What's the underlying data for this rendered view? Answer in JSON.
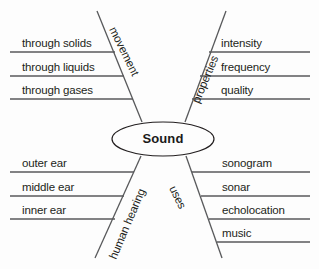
{
  "diagram": {
    "title": "Sound",
    "type": "concept-map",
    "center": {
      "label": "Sound",
      "shape": "ellipse",
      "cx": 163,
      "cy": 139,
      "rx": 51,
      "ry": 17
    },
    "colors": {
      "stroke": "#58595b",
      "text": "#231f20",
      "background": "#fdfdfd",
      "center_stroke": "#231f20"
    },
    "branches": [
      {
        "id": "movement",
        "label": "movement",
        "position": "top-left",
        "rotation_deg": 64,
        "label_x": 112,
        "label_y": 22,
        "stem": {
          "x1": 97,
          "y1": 11,
          "x2": 142,
          "y2": 122
        },
        "items": [
          {
            "text": "through solids",
            "line_y": 52,
            "line_x1": 10,
            "line_x2": 115,
            "text_x": 22,
            "text_y": 38
          },
          {
            "text": "through liquids",
            "line_y": 76,
            "line_x1": 10,
            "line_x2": 124,
            "text_x": 22,
            "text_y": 62
          },
          {
            "text": "through gases",
            "line_y": 99,
            "line_x1": 10,
            "line_x2": 133,
            "text_x": 22,
            "text_y": 85
          }
        ]
      },
      {
        "id": "properties",
        "label": "properties",
        "position": "top-right",
        "rotation_deg": -67,
        "label_x": 196,
        "label_y": 97,
        "stem": {
          "x1": 226,
          "y1": 11,
          "x2": 185,
          "y2": 122
        },
        "items": [
          {
            "text": "intensity",
            "line_y": 52,
            "line_x1": 209,
            "line_x2": 310,
            "text_x": 221,
            "text_y": 38
          },
          {
            "text": "frequency",
            "line_y": 76,
            "line_x1": 200,
            "line_x2": 310,
            "text_x": 221,
            "text_y": 62
          },
          {
            "text": "quality",
            "line_y": 99,
            "line_x1": 192,
            "line_x2": 310,
            "text_x": 221,
            "text_y": 85
          }
        ]
      },
      {
        "id": "human-hearing",
        "label": "human hearing",
        "position": "bottom-left",
        "rotation_deg": -67,
        "label_x": 113,
        "label_y": 253,
        "stem": {
          "x1": 141,
          "y1": 156,
          "x2": 95,
          "y2": 258
        },
        "items": [
          {
            "text": "outer ear",
            "line_y": 172,
            "line_x1": 10,
            "line_x2": 134,
            "text_x": 22,
            "text_y": 158
          },
          {
            "text": "middle ear",
            "line_y": 196,
            "line_x1": 10,
            "line_x2": 124,
            "text_x": 22,
            "text_y": 182
          },
          {
            "text": "inner ear",
            "line_y": 219,
            "line_x1": 10,
            "line_x2": 115,
            "text_x": 22,
            "text_y": 205
          }
        ]
      },
      {
        "id": "uses",
        "label": "uses",
        "position": "bottom-right",
        "rotation_deg": 64,
        "label_x": 172,
        "label_y": 181,
        "stem": {
          "x1": 186,
          "y1": 156,
          "x2": 222,
          "y2": 258
        },
        "items": [
          {
            "text": "sonogram",
            "line_y": 172,
            "line_x1": 192,
            "line_x2": 310,
            "text_x": 222,
            "text_y": 158
          },
          {
            "text": "sonar",
            "line_y": 196,
            "line_x1": 201,
            "line_x2": 310,
            "text_x": 222,
            "text_y": 182
          },
          {
            "text": "echolocation",
            "line_y": 219,
            "line_x1": 209,
            "line_x2": 310,
            "text_x": 222,
            "text_y": 205
          },
          {
            "text": "music",
            "line_y": 242,
            "line_x1": 217,
            "line_x2": 310,
            "text_x": 222,
            "text_y": 228
          }
        ]
      }
    ]
  }
}
